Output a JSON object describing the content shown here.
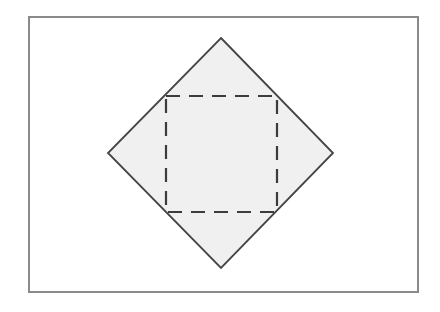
{
  "figure": {
    "name": "inscribed-square-in-rotated-square-diagram",
    "canvas": {
      "width": 440,
      "height": 312,
      "background_color": "#ffffff"
    },
    "frame": {
      "label": "outer-rectangle-frame",
      "x": 29,
      "y": 17,
      "width": 389,
      "height": 275,
      "stroke_color": "#8a8a8a",
      "stroke_width": 2,
      "fill": "none"
    },
    "shapes": [
      {
        "label": "rotated-square-diamond",
        "type": "polygon",
        "points": "221,38 333,153 221,268 108,153",
        "vertices": {
          "top": [
            221,
            38
          ],
          "right": [
            333,
            153
          ],
          "bottom": [
            221,
            268
          ],
          "left": [
            108,
            153
          ]
        },
        "fill_color": "#f0f0f0",
        "stroke_color": "#444444",
        "stroke_width": 1.8,
        "stroke_style": "solid"
      },
      {
        "label": "inner-dashed-square",
        "type": "rect",
        "x": 166,
        "y": 96,
        "width": 111,
        "height": 116,
        "fill": "none",
        "stroke_color": "#3c3c3c",
        "stroke_width": 2.2,
        "stroke_style": "dashed",
        "dash_on": 14,
        "dash_off": 9
      }
    ]
  }
}
